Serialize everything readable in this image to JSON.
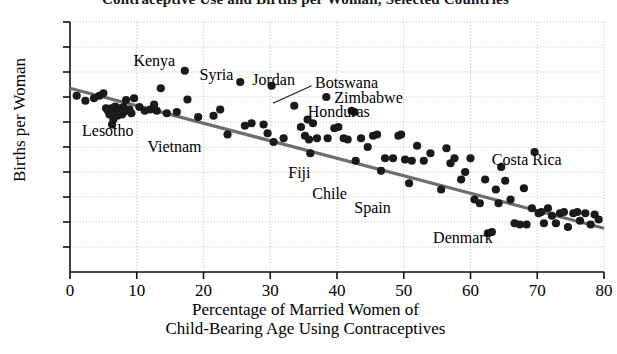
{
  "chart_data": {
    "type": "scatter",
    "title": "Contraceptive Use and Births per Woman, Selected Countries",
    "xlabel": "Percentage of Married Women of Child-Bearing Age Using Contraceptives",
    "xlabel_line1": "Percentage of Married Women of",
    "xlabel_line2": "Child-Bearing Age Using Contraceptives",
    "ylabel": "Births per Woman",
    "xlim": [
      0,
      80
    ],
    "ylim": [
      0,
      10
    ],
    "xticks": [
      0,
      10,
      20,
      30,
      40,
      50,
      60,
      70,
      80
    ],
    "yticks": [
      0,
      1,
      2,
      3,
      4,
      5,
      6,
      7,
      8,
      9,
      10
    ],
    "xtick_labels": [
      "0",
      "10",
      "20",
      "30",
      "40",
      "50",
      "60",
      "70",
      "80"
    ],
    "ytick_labels": [
      "",
      "1",
      "2",
      "3",
      "4",
      "5",
      "6",
      "7",
      "8",
      "9",
      "10"
    ],
    "grid": true,
    "grid_style": "dotted",
    "grid_color": "#b9b9b9",
    "point_color": "#1a1a1a",
    "point_size": 4.1,
    "legend": "none",
    "trendline": {
      "label": "least-squares regression line",
      "color": "#6e6e6e",
      "width": 3.2,
      "x_start": 0.0,
      "y_start": 7.35,
      "x_end": 80.0,
      "y_end": 1.75
    },
    "points": [
      {
        "x": 1.0,
        "y": 7.05
      },
      {
        "x": 2.3,
        "y": 6.85
      },
      {
        "x": 3.6,
        "y": 6.95
      },
      {
        "x": 4.4,
        "y": 7.05
      },
      {
        "x": 5.0,
        "y": 7.15
      },
      {
        "x": 5.4,
        "y": 6.55
      },
      {
        "x": 5.7,
        "y": 6.45
      },
      {
        "x": 5.9,
        "y": 6.3
      },
      {
        "x": 6.2,
        "y": 6.55
      },
      {
        "x": 6.5,
        "y": 6.35
      },
      {
        "x": 6.5,
        "y": 6.1
      },
      {
        "x": 6.8,
        "y": 6.62
      },
      {
        "x": 7.0,
        "y": 6.42
      },
      {
        "x": 7.1,
        "y": 6.25
      },
      {
        "x": 7.3,
        "y": 6.55
      },
      {
        "x": 7.6,
        "y": 6.45
      },
      {
        "x": 7.8,
        "y": 6.3
      },
      {
        "x": 8.0,
        "y": 6.6
      },
      {
        "x": 8.2,
        "y": 6.42
      },
      {
        "x": 8.4,
        "y": 6.88
      },
      {
        "x": 6.3,
        "y": 5.9
      },
      {
        "x": 8.9,
        "y": 6.5
      },
      {
        "x": 9.2,
        "y": 6.35
      },
      {
        "x": 9.6,
        "y": 6.95
      },
      {
        "x": 10.4,
        "y": 6.6
      },
      {
        "x": 11.2,
        "y": 6.45
      },
      {
        "x": 12.0,
        "y": 6.5
      },
      {
        "x": 12.6,
        "y": 6.7
      },
      {
        "x": 13.0,
        "y": 6.45
      },
      {
        "x": 13.6,
        "y": 7.35
      },
      {
        "x": 14.5,
        "y": 6.35
      },
      {
        "x": 16.0,
        "y": 6.4
      },
      {
        "x": 17.2,
        "y": 8.05
      },
      {
        "x": 17.6,
        "y": 6.9
      },
      {
        "x": 19.2,
        "y": 6.2
      },
      {
        "x": 21.5,
        "y": 6.25
      },
      {
        "x": 22.5,
        "y": 6.5
      },
      {
        "x": 23.6,
        "y": 5.5
      },
      {
        "x": 25.5,
        "y": 7.6
      },
      {
        "x": 26.2,
        "y": 5.85
      },
      {
        "x": 27.2,
        "y": 5.95
      },
      {
        "x": 29.0,
        "y": 5.9
      },
      {
        "x": 29.6,
        "y": 5.55
      },
      {
        "x": 30.2,
        "y": 7.45
      },
      {
        "x": 30.5,
        "y": 5.2
      },
      {
        "x": 32.0,
        "y": 5.35
      },
      {
        "x": 33.6,
        "y": 6.65
      },
      {
        "x": 34.6,
        "y": 5.8
      },
      {
        "x": 35.2,
        "y": 5.45
      },
      {
        "x": 35.6,
        "y": 6.1
      },
      {
        "x": 35.8,
        "y": 5.3
      },
      {
        "x": 36.0,
        "y": 4.75
      },
      {
        "x": 36.4,
        "y": 5.95
      },
      {
        "x": 37.0,
        "y": 5.35
      },
      {
        "x": 38.4,
        "y": 7.0
      },
      {
        "x": 38.6,
        "y": 5.35
      },
      {
        "x": 39.6,
        "y": 5.75
      },
      {
        "x": 40.2,
        "y": 5.8
      },
      {
        "x": 41.0,
        "y": 5.35
      },
      {
        "x": 41.6,
        "y": 5.3
      },
      {
        "x": 42.2,
        "y": 6.45
      },
      {
        "x": 42.6,
        "y": 6.4
      },
      {
        "x": 42.8,
        "y": 4.45
      },
      {
        "x": 43.6,
        "y": 5.35
      },
      {
        "x": 44.6,
        "y": 5.0
      },
      {
        "x": 45.4,
        "y": 5.45
      },
      {
        "x": 46.0,
        "y": 5.5
      },
      {
        "x": 46.6,
        "y": 4.05
      },
      {
        "x": 47.2,
        "y": 4.55
      },
      {
        "x": 48.4,
        "y": 4.55
      },
      {
        "x": 49.2,
        "y": 5.45
      },
      {
        "x": 49.6,
        "y": 5.5
      },
      {
        "x": 50.2,
        "y": 4.5
      },
      {
        "x": 50.8,
        "y": 3.55
      },
      {
        "x": 51.2,
        "y": 4.45
      },
      {
        "x": 52.0,
        "y": 5.05
      },
      {
        "x": 53.0,
        "y": 4.45
      },
      {
        "x": 54.0,
        "y": 4.75
      },
      {
        "x": 55.6,
        "y": 3.3
      },
      {
        "x": 56.4,
        "y": 4.95
      },
      {
        "x": 57.0,
        "y": 4.35
      },
      {
        "x": 57.6,
        "y": 4.55
      },
      {
        "x": 58.6,
        "y": 3.7
      },
      {
        "x": 59.2,
        "y": 4.0
      },
      {
        "x": 60.0,
        "y": 4.55
      },
      {
        "x": 60.6,
        "y": 2.9
      },
      {
        "x": 61.4,
        "y": 2.75
      },
      {
        "x": 62.2,
        "y": 3.7
      },
      {
        "x": 62.6,
        "y": 1.55
      },
      {
        "x": 63.2,
        "y": 1.6
      },
      {
        "x": 63.8,
        "y": 3.3
      },
      {
        "x": 64.2,
        "y": 2.75
      },
      {
        "x": 64.6,
        "y": 4.2
      },
      {
        "x": 65.2,
        "y": 3.65
      },
      {
        "x": 66.0,
        "y": 2.9
      },
      {
        "x": 66.6,
        "y": 1.95
      },
      {
        "x": 67.4,
        "y": 1.9
      },
      {
        "x": 68.0,
        "y": 3.35
      },
      {
        "x": 68.4,
        "y": 1.9
      },
      {
        "x": 69.2,
        "y": 2.55
      },
      {
        "x": 69.6,
        "y": 4.8
      },
      {
        "x": 70.2,
        "y": 2.35
      },
      {
        "x": 70.6,
        "y": 2.4
      },
      {
        "x": 71.0,
        "y": 1.95
      },
      {
        "x": 71.6,
        "y": 2.55
      },
      {
        "x": 72.2,
        "y": 2.25
      },
      {
        "x": 72.8,
        "y": 1.95
      },
      {
        "x": 73.4,
        "y": 2.35
      },
      {
        "x": 74.0,
        "y": 2.4
      },
      {
        "x": 74.6,
        "y": 1.8
      },
      {
        "x": 75.4,
        "y": 2.35
      },
      {
        "x": 76.0,
        "y": 2.4
      },
      {
        "x": 76.4,
        "y": 2.05
      },
      {
        "x": 77.2,
        "y": 2.35
      },
      {
        "x": 78.0,
        "y": 1.9
      },
      {
        "x": 78.6,
        "y": 2.3
      },
      {
        "x": 79.2,
        "y": 2.1
      }
    ],
    "annotations": [
      {
        "name": "Kenya",
        "text": "Kenya",
        "x": 9.5,
        "y": 8.45,
        "anchor": "start"
      },
      {
        "name": "Syria",
        "text": "Syria",
        "x": 19.4,
        "y": 7.9,
        "anchor": "start"
      },
      {
        "name": "Jordan",
        "text": "Jordan",
        "x": 27.3,
        "y": 7.68,
        "anchor": "start"
      },
      {
        "name": "Botswana",
        "text": "Botswana",
        "x": 36.7,
        "y": 7.58,
        "anchor": "start"
      },
      {
        "name": "Zimbabwe",
        "text": "Zimbabwe",
        "x": 39.6,
        "y": 6.95,
        "anchor": "start"
      },
      {
        "name": "Honduras",
        "text": "Honduras",
        "x": 35.6,
        "y": 6.4,
        "anchor": "start"
      },
      {
        "name": "Lesotho",
        "text": "Lesotho",
        "x": 1.8,
        "y": 5.65,
        "anchor": "start"
      },
      {
        "name": "Vietnam",
        "text": "Vietnam",
        "x": 11.6,
        "y": 5.0,
        "anchor": "start"
      },
      {
        "name": "Fiji",
        "text": "Fiji",
        "x": 32.7,
        "y": 3.98,
        "anchor": "start"
      },
      {
        "name": "Chile",
        "text": "Chile",
        "x": 36.3,
        "y": 3.12,
        "anchor": "start"
      },
      {
        "name": "Spain",
        "text": "Spain",
        "x": 42.6,
        "y": 2.55,
        "anchor": "start"
      },
      {
        "name": "Costa Rica",
        "text": "Costa Rica",
        "x": 63.2,
        "y": 4.5,
        "anchor": "start"
      },
      {
        "name": "Denmark",
        "text": "Denmark",
        "x": 54.4,
        "y": 1.35,
        "anchor": "start"
      }
    ],
    "leader_lines": [
      {
        "name": "botswana-leader",
        "x1": 36.2,
        "y1": 7.45,
        "x2": 30.4,
        "y2": 6.75
      }
    ]
  }
}
